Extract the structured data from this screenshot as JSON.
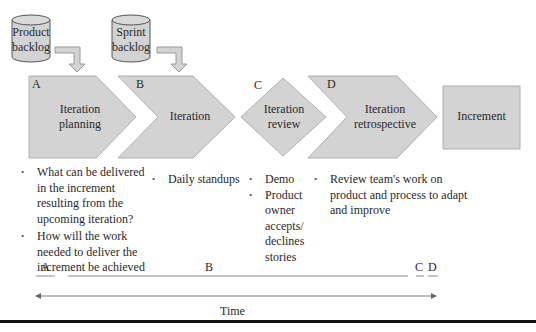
{
  "colors": {
    "shape_fill": "#d3d3d3",
    "shape_stroke": "#a8a8a8",
    "text": "#2a2a2a",
    "rule": "#111111"
  },
  "backlogs": [
    {
      "id": "product-backlog",
      "label_line1": "Product",
      "label_line2": "backlog"
    },
    {
      "id": "sprint-backlog",
      "label_line1": "Sprint",
      "label_line2": "backlog"
    }
  ],
  "stages": [
    {
      "letter": "A",
      "label_line1": "Iteration",
      "label_line2": "planning",
      "shape": "pentagon-arrow"
    },
    {
      "letter": "B",
      "label_line1": "Iteration",
      "label_line2": "",
      "shape": "chevron"
    },
    {
      "letter": "C",
      "label_line1": "Iteration",
      "label_line2": "review",
      "shape": "diamond"
    },
    {
      "letter": "D",
      "label_line1": "Iteration",
      "label_line2": "retrospective",
      "shape": "chevron"
    },
    {
      "letter": "",
      "label_line1": "Increment",
      "label_line2": "",
      "shape": "rectangle"
    }
  ],
  "bullets": {
    "planning": [
      "What can be delivered in the increment resulting from the upcoming iteration?",
      "How will the work needed to deliver the increment be achieved"
    ],
    "iteration": [
      "Daily standups"
    ],
    "review": [
      "Demo",
      "Product owner accepts/ declines stories"
    ],
    "retrospective": [
      "Review team's work on product and process to adapt and improve"
    ]
  },
  "timeline": {
    "segments": [
      {
        "label": "A"
      },
      {
        "label": "B"
      },
      {
        "label": "C"
      },
      {
        "label": "D"
      }
    ],
    "axis_label": "Time"
  }
}
